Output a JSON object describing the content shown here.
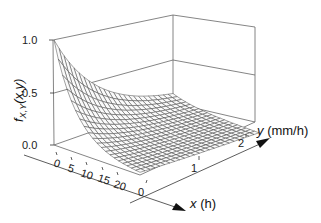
{
  "chart_data": {
    "type": "surface3d",
    "title": "",
    "function": "f_{X,Y}(x,y) = exp(-x/a) * exp(-y/b)-like decaying surface",
    "zlabel": "f_{X,Y}(x,y)",
    "xlabel": "x (h)",
    "ylabel": "y (mm/h)",
    "x_ticks": [
      0,
      5,
      10,
      15,
      20
    ],
    "y_ticks": [
      0,
      1,
      2
    ],
    "z_ticks": [
      "0.0",
      "0.5",
      "1.0"
    ],
    "xlim": [
      0,
      22
    ],
    "ylim": [
      0,
      2.4
    ],
    "zlim": [
      0,
      1
    ],
    "surface_description": "Mesh surface starting at 1.0 at origin (x=0,y=0), decaying rapidly along x toward 0 near x≈15-20, and decaying along y; nearly flat near 0 over most of domain.",
    "grid": "box with back planes at z=0.5 and z=1.0",
    "x_decay_scale": 6,
    "y_decay_scale": 1.0,
    "mesh_rows": 20,
    "mesh_cols": 24
  },
  "labels": {
    "z_axis": "f",
    "z_axis_sub": "X,Y",
    "z_axis_args": "(x,y)",
    "x_axis_var": "x",
    "x_axis_unit": "(h)",
    "y_axis_var": "y",
    "y_axis_unit": "(mm/h)",
    "z_tick_0": "0.0",
    "z_tick_1": "0.5",
    "z_tick_2": "1.0",
    "x_tick_0": "0",
    "x_tick_1": "5",
    "x_tick_2": "10",
    "x_tick_3": "15",
    "x_tick_4": "20",
    "y_tick_0": "0",
    "y_tick_1": "1",
    "y_tick_2": "2"
  }
}
